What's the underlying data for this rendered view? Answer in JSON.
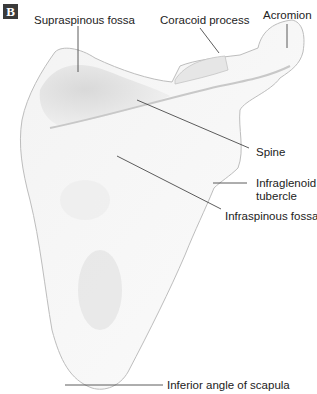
{
  "figure": {
    "panel_letter": "B",
    "labels": {
      "supraspinous_fossa": "Supraspinous fossa",
      "coracoid_process": "Coracoid process",
      "acromion": "Acromion",
      "spine": "Spine",
      "infraglenoid_tubercle_line1": "Infraglenoid",
      "infraglenoid_tubercle_line2": "tubercle",
      "infraspinous_fossa": "Infraspinous fossa",
      "inferior_angle": "Inferior angle of scapula"
    }
  }
}
